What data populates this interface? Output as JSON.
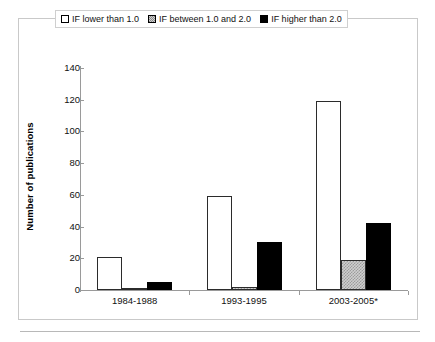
{
  "chart_data": {
    "type": "bar",
    "title": "",
    "xlabel": "",
    "ylabel": "Number of publications",
    "categories": [
      "1984-1988",
      "1993-1995",
      "2003-2005*"
    ],
    "series": [
      {
        "name": "IF lower than 1.0",
        "values": [
          21,
          59,
          119
        ],
        "fill": "white",
        "swatch": "sw-white"
      },
      {
        "name": "IF between 1.0 and 2.0",
        "values": [
          1,
          2,
          19
        ],
        "fill": "stipple",
        "swatch": "sw-stipple"
      },
      {
        "name": "IF higher than 2.0",
        "values": [
          5,
          30,
          42
        ],
        "fill": "black",
        "swatch": "sw-black"
      }
    ],
    "ylim": [
      0,
      140
    ],
    "yticks": [
      0,
      20,
      40,
      60,
      80,
      100,
      120,
      140
    ],
    "ytick_labels": [
      "0",
      "20",
      "40",
      "60",
      "80",
      "100",
      "120",
      "140"
    ],
    "grid": false,
    "legend_position": "top-center",
    "colors": {
      "series_1": "#ffffff",
      "series_2": "#cfcfcf",
      "series_3": "#000000",
      "axis": "#9a9a9a",
      "frame": "#c9c9c9",
      "text": "#111111"
    }
  },
  "legend": {
    "entries": [
      {
        "label": "IF lower than 1.0"
      },
      {
        "label": "IF between 1.0 and 2.0"
      },
      {
        "label": "IF higher than 2.0"
      }
    ]
  }
}
